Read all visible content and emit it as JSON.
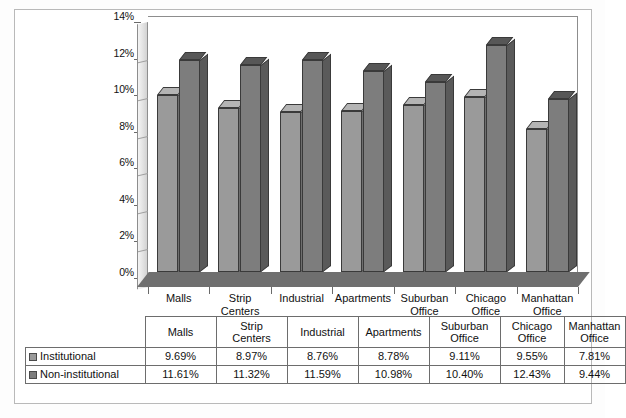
{
  "chart_data": {
    "type": "bar",
    "title": "",
    "subtitle": "",
    "xlabel": "",
    "ylabel": "",
    "ylim": [
      0,
      14
    ],
    "ytick_labels": [
      "0%",
      "2%",
      "4%",
      "6%",
      "8%",
      "10%",
      "12%",
      "14%"
    ],
    "ytick_values": [
      0,
      2,
      4,
      6,
      8,
      10,
      12,
      14
    ],
    "grid": false,
    "legend_position": "table-row-headers",
    "categories": [
      "Malls",
      "Strip Centers",
      "Industrial",
      "Apartments",
      "Suburban Office",
      "Chicago Office",
      "Manhattan Office"
    ],
    "series": [
      {
        "name": "Institutional",
        "color": "#9a9a9a",
        "values": [
          9.69,
          8.97,
          8.76,
          8.78,
          9.11,
          9.55,
          7.81
        ],
        "labels": [
          "9.69%",
          "8.97%",
          "8.76%",
          "8.78%",
          "9.11%",
          "9.55%",
          "7.81%"
        ]
      },
      {
        "name": "Non-institutional",
        "color": "#7d7d7d",
        "values": [
          11.61,
          11.32,
          11.59,
          10.98,
          10.4,
          12.43,
          9.44
        ],
        "labels": [
          "11.61%",
          "11.32%",
          "11.59%",
          "10.98%",
          "10.40%",
          "12.43%",
          "9.44%"
        ]
      }
    ]
  },
  "axis": {
    "y_ticks": [
      {
        "label": "14%",
        "value": 14
      },
      {
        "label": "12%",
        "value": 12
      },
      {
        "label": "10%",
        "value": 10
      },
      {
        "label": "8%",
        "value": 8
      },
      {
        "label": "6%",
        "value": 6
      },
      {
        "label": "4%",
        "value": 4
      },
      {
        "label": "2%",
        "value": 2
      },
      {
        "label": "0%",
        "value": 0
      }
    ],
    "x_categories": [
      {
        "line1": "Malls",
        "line2": ""
      },
      {
        "line1": "Strip",
        "line2": "Centers"
      },
      {
        "line1": "Industrial",
        "line2": ""
      },
      {
        "line1": "Apartments",
        "line2": ""
      },
      {
        "line1": "Suburban",
        "line2": "Office"
      },
      {
        "line1": "Chicago",
        "line2": "Office"
      },
      {
        "line1": "Manhattan",
        "line2": "Office"
      }
    ]
  },
  "table": {
    "corner": "",
    "headers": [
      {
        "line1": "Malls",
        "line2": ""
      },
      {
        "line1": "Strip",
        "line2": "Centers"
      },
      {
        "line1": "Industrial",
        "line2": ""
      },
      {
        "line1": "Apartments",
        "line2": ""
      },
      {
        "line1": "Suburban",
        "line2": "Office"
      },
      {
        "line1": "Chicago",
        "line2": "Office"
      },
      {
        "line1": "Manhattan",
        "line2": "Office"
      }
    ],
    "rows": [
      {
        "label": "Institutional",
        "swatch_color": "#9a9a9a",
        "cells": [
          "9.69%",
          "8.97%",
          "8.76%",
          "8.78%",
          "9.11%",
          "9.55%",
          "7.81%"
        ]
      },
      {
        "label": "Non-institutional",
        "swatch_color": "#7d7d7d",
        "cells": [
          "11.61%",
          "11.32%",
          "11.59%",
          "10.98%",
          "10.40%",
          "12.43%",
          "9.44%"
        ]
      }
    ]
  }
}
